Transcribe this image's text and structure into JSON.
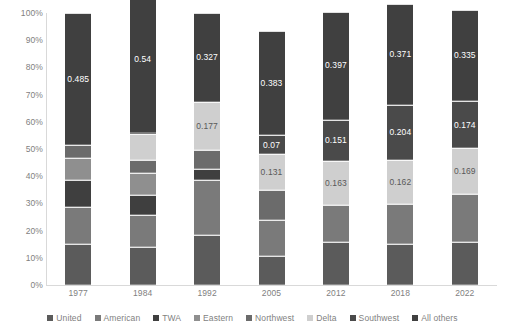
{
  "chart_data": {
    "type": "bar",
    "title": "",
    "subtitle": "",
    "xlabel": "",
    "ylabel": "",
    "stacked": true,
    "stack_mode": "percent",
    "grid": false,
    "legend_position": "bottom",
    "ylim": [
      0,
      1
    ],
    "ytick_labels": [
      "0%",
      "10%",
      "20%",
      "30%",
      "40%",
      "50%",
      "60%",
      "70%",
      "80%",
      "90%",
      "100%"
    ],
    "ytick_values": [
      0,
      0.1,
      0.2,
      0.3,
      0.4,
      0.5,
      0.6,
      0.7,
      0.8,
      0.9,
      1.0
    ],
    "categories": [
      "1977",
      "1984",
      "1992",
      "2005",
      "2012",
      "2018",
      "2022"
    ],
    "series": [
      {
        "name": "United",
        "color": "#5b5b5b",
        "values": [
          0.152,
          0.138,
          0.185,
          0.107,
          0.157,
          0.149,
          0.158
        ]
      },
      {
        "name": "American",
        "color": "#7a7a7a",
        "values": [
          0.135,
          0.118,
          0.2,
          0.132,
          0.137,
          0.148,
          0.175
        ]
      },
      {
        "name": "TWA",
        "color": "#3f3f3f",
        "values": [
          0.098,
          0.076,
          0.04,
          0.0,
          0.0,
          0.0,
          0.0
        ]
      },
      {
        "name": "Eastern",
        "color": "#8f8f8f",
        "values": [
          0.083,
          0.081,
          0.0,
          0.0,
          0.0,
          0.0,
          0.0
        ]
      },
      {
        "name": "Northwest",
        "color": "#6b6b6b",
        "values": [
          0.047,
          0.047,
          0.071,
          0.11,
          0.0,
          0.0,
          0.0
        ]
      },
      {
        "name": "Delta",
        "color": "#cfcfcf",
        "values": [
          0.0,
          0.095,
          0.177,
          0.131,
          0.163,
          0.162,
          0.169
        ]
      },
      {
        "name": "Southwest",
        "color": "#4a4a4a",
        "values": [
          0.0,
          0.005,
          0.0,
          0.07,
          0.151,
          0.204,
          0.174
        ]
      },
      {
        "name": "All others",
        "color": "#404040",
        "values": [
          0.485,
          0.54,
          0.327,
          0.383,
          0.397,
          0.371,
          0.335
        ]
      }
    ],
    "data_labels": [
      {
        "category": "1977",
        "series": "Delta",
        "text": "0"
      },
      {
        "category": "1977",
        "series": "All others",
        "text": "0.485"
      },
      {
        "category": "1984",
        "series": "All others",
        "text": "0.54"
      },
      {
        "category": "1992",
        "series": "Delta",
        "text": "0.177"
      },
      {
        "category": "1992",
        "series": "All others",
        "text": "0.327"
      },
      {
        "category": "2005",
        "series": "Delta",
        "text": "0.131"
      },
      {
        "category": "2005",
        "series": "Southwest",
        "text": "0.07"
      },
      {
        "category": "2005",
        "series": "All others",
        "text": "0.383"
      },
      {
        "category": "2012",
        "series": "Delta",
        "text": "0.163"
      },
      {
        "category": "2012",
        "series": "Southwest",
        "text": "0.151"
      },
      {
        "category": "2012",
        "series": "All others",
        "text": "0.397"
      },
      {
        "category": "2018",
        "series": "Delta",
        "text": "0.162"
      },
      {
        "category": "2018",
        "series": "Southwest",
        "text": "0.204"
      },
      {
        "category": "2018",
        "series": "All others",
        "text": "0.371"
      },
      {
        "category": "2022",
        "series": "Delta",
        "text": "0.169"
      },
      {
        "category": "2022",
        "series": "Southwest",
        "text": "0.174"
      },
      {
        "category": "2022",
        "series": "All others",
        "text": "0.335"
      }
    ]
  },
  "legend": {
    "items": [
      {
        "label": "United"
      },
      {
        "label": "American"
      },
      {
        "label": "TWA"
      },
      {
        "label": "Eastern"
      },
      {
        "label": "Northwest"
      },
      {
        "label": "Delta"
      },
      {
        "label": "Southwest"
      },
      {
        "label": "All others"
      }
    ]
  },
  "colors": {
    "axis": "#d9d9d9",
    "tick_text": "#7f7f7f",
    "label_light": "#ffffff",
    "label_dark": "#595959",
    "background": "#ffffff"
  }
}
